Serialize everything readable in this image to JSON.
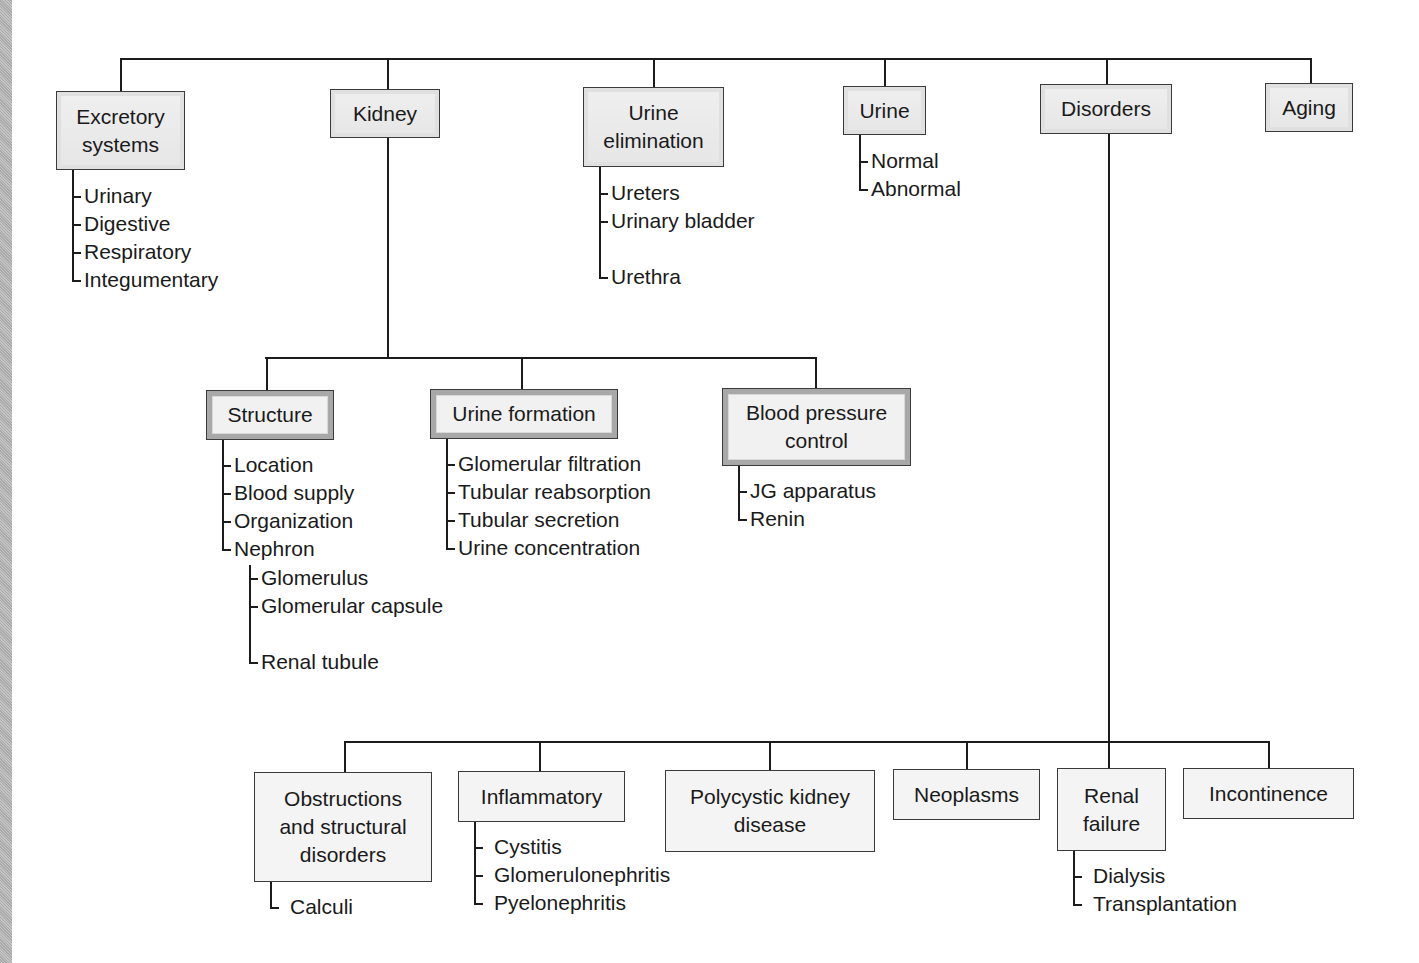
{
  "diagram": {
    "line_color": "#1c1c1c",
    "top_level": [
      {
        "id": "excretory",
        "label": "Excretory\nsystems",
        "box": [
          56,
          91,
          129,
          79
        ],
        "anchor_x": 120,
        "children": [
          "Urinary",
          "Digestive",
          "Respiratory",
          "Integumentary"
        ]
      },
      {
        "id": "kidney",
        "label": "Kidney",
        "box": [
          330,
          89,
          110,
          49
        ],
        "anchor_x": 387,
        "children": []
      },
      {
        "id": "urine-elimination",
        "label": "Urine\nelimination",
        "box": [
          583,
          87,
          141,
          80
        ],
        "anchor_x": 653,
        "children": [
          "Ureters",
          "Urinary\n   bladder",
          "Urethra"
        ]
      },
      {
        "id": "urine",
        "label": "Urine",
        "box": [
          843,
          86,
          83,
          49
        ],
        "anchor_x": 884,
        "children": [
          "Normal",
          "Abnormal"
        ]
      },
      {
        "id": "disorders",
        "label": "Disorders",
        "box": [
          1040,
          84,
          132,
          50
        ],
        "anchor_x": 1106,
        "children": []
      },
      {
        "id": "aging",
        "label": "Aging",
        "box": [
          1265,
          83,
          88,
          49
        ],
        "anchor_x": 1310,
        "children": []
      }
    ],
    "kidney_children": [
      {
        "id": "structure",
        "label": "Structure",
        "box": [
          206,
          390,
          128,
          50
        ],
        "anchor_x": 266,
        "children": [
          "Location",
          "Blood supply",
          "Organization",
          "Nephron"
        ],
        "nephron_children": [
          "Glomerulus",
          "Glomerular\n   capsule",
          "Renal tubule"
        ]
      },
      {
        "id": "urine-formation",
        "label": "Urine formation",
        "box": [
          430,
          389,
          188,
          50
        ],
        "anchor_x": 521,
        "children": [
          "Glomerular filtration",
          "Tubular reabsorption",
          "Tubular secretion",
          "Urine concentration"
        ]
      },
      {
        "id": "blood-pressure-control",
        "label": "Blood pressure\ncontrol",
        "box": [
          722,
          388,
          189,
          78
        ],
        "anchor_x": 815,
        "children": [
          "JG apparatus",
          "Renin"
        ]
      }
    ],
    "disorder_children": [
      {
        "id": "obstructions",
        "label": "Obstructions\nand structural\ndisorders",
        "box": [
          254,
          772,
          178,
          110
        ],
        "anchor_x": 344,
        "children": [
          "Calculi"
        ]
      },
      {
        "id": "inflammatory",
        "label": "Inflammatory",
        "box": [
          458,
          771,
          167,
          51
        ],
        "anchor_x": 539,
        "children": [
          "Cystitis",
          "Glomerulonephritis",
          "Pyelonephritis"
        ]
      },
      {
        "id": "polycystic",
        "label": "Polycystic kidney\ndisease",
        "box": [
          665,
          770,
          210,
          82
        ],
        "anchor_x": 769,
        "children": []
      },
      {
        "id": "neoplasms",
        "label": "Neoplasms",
        "box": [
          893,
          769,
          147,
          51
        ],
        "anchor_x": 966,
        "children": []
      },
      {
        "id": "renal-failure",
        "label": "Renal\nfailure",
        "box": [
          1057,
          768,
          109,
          83
        ],
        "anchor_x": 1108,
        "children": [
          "Dialysis",
          "Transplantation"
        ]
      },
      {
        "id": "incontinence",
        "label": "Incontinence",
        "box": [
          1183,
          768,
          171,
          51
        ],
        "anchor_x": 1268,
        "children": []
      }
    ]
  }
}
